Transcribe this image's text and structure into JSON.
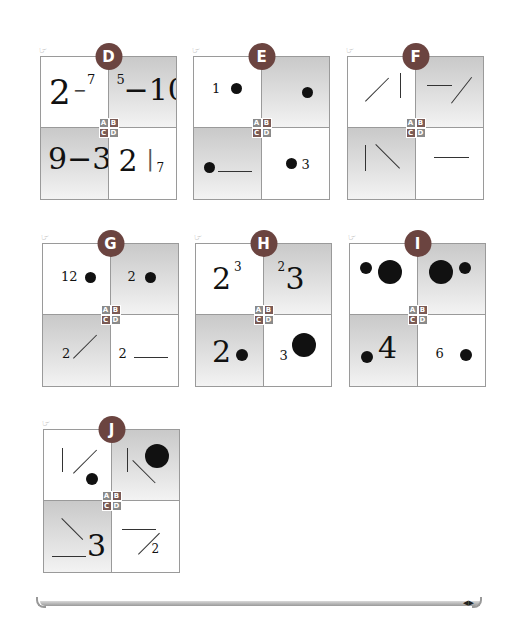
{
  "panels": [
    {
      "id": "D",
      "label": "D",
      "quadrants": {
        "A": {
          "shaded": false,
          "content": "2 − 7 (large 2, dash, small superscript 7)",
          "texts": [
            "2",
            "−",
            "7"
          ]
        },
        "B": {
          "shaded": true,
          "content": "5−10 (small superscript 5, dash, large 10)",
          "texts": [
            "5",
            "−10"
          ]
        },
        "C": {
          "shaded": true,
          "content": "9−3",
          "texts": [
            "9−3"
          ]
        },
        "D": {
          "shaded": false,
          "content": "2 | 7 (large 2, vertical bar, small 7)",
          "texts": [
            "2",
            "|",
            "7"
          ]
        }
      }
    },
    {
      "id": "E",
      "label": "E",
      "quadrants": {
        "A": {
          "shaded": false,
          "content": "1 and one dot",
          "texts": [
            "1"
          ]
        },
        "B": {
          "shaded": true,
          "content": "one dot",
          "texts": []
        },
        "C": {
          "shaded": true,
          "content": "dot and horizontal line",
          "texts": []
        },
        "D": {
          "shaded": false,
          "content": "dot and 3",
          "texts": [
            "3"
          ]
        }
      }
    },
    {
      "id": "F",
      "label": "F",
      "quadrants": {
        "A": {
          "shaded": false,
          "content": "diagonal line / and vertical line"
        },
        "B": {
          "shaded": true,
          "content": "horizontal line and diagonal line /"
        },
        "C": {
          "shaded": true,
          "content": "vertical line and diagonal line \\"
        },
        "D": {
          "shaded": false,
          "content": "horizontal line"
        }
      }
    },
    {
      "id": "G",
      "label": "G",
      "quadrants": {
        "A": {
          "shaded": false,
          "content": "12 and dot",
          "texts": [
            "12"
          ]
        },
        "B": {
          "shaded": true,
          "content": "2 and dot",
          "texts": [
            "2"
          ]
        },
        "C": {
          "shaded": true,
          "content": "2 and diagonal line /",
          "texts": [
            "2"
          ]
        },
        "D": {
          "shaded": false,
          "content": "2 and horizontal line",
          "texts": [
            "2"
          ]
        }
      }
    },
    {
      "id": "H",
      "label": "H",
      "quadrants": {
        "A": {
          "shaded": false,
          "content": "large 2 with superscript 3",
          "texts": [
            "2",
            "3"
          ]
        },
        "B": {
          "shaded": true,
          "content": "superscript 2 with large 3",
          "texts": [
            "2",
            "3"
          ]
        },
        "C": {
          "shaded": true,
          "content": "large 2 and small dot",
          "texts": [
            "2"
          ]
        },
        "D": {
          "shaded": false,
          "content": "small 3 and large dot",
          "texts": [
            "3"
          ]
        }
      }
    },
    {
      "id": "I",
      "label": "I",
      "quadrants": {
        "A": {
          "shaded": false,
          "content": "small dot and large dot"
        },
        "B": {
          "shaded": true,
          "content": "large dot and small dot"
        },
        "C": {
          "shaded": true,
          "content": "small dot and large 4",
          "texts": [
            "4"
          ]
        },
        "D": {
          "shaded": false,
          "content": "6 and dot",
          "texts": [
            "6"
          ]
        }
      }
    },
    {
      "id": "J",
      "label": "J",
      "quadrants": {
        "A": {
          "shaded": false,
          "content": "vertical line, diagonal line /, small dot"
        },
        "B": {
          "shaded": true,
          "content": "vertical line, diagonal line \\, large dot"
        },
        "C": {
          "shaded": true,
          "content": "diagonal line \\, horizontal line, large 3",
          "texts": [
            "3"
          ]
        },
        "D": {
          "shaded": false,
          "content": "horizontal line, diagonal line /, small 2",
          "texts": [
            "2"
          ]
        }
      }
    }
  ],
  "key": {
    "A": "A",
    "B": "B",
    "C": "C",
    "D": "D"
  },
  "text": {
    "D": {
      "a1": "2",
      "a2": "−",
      "a3": "7",
      "b1": "5",
      "b2": "−10",
      "c1": "9−3",
      "d1": "2",
      "d2": "|",
      "d3": "7"
    },
    "E": {
      "a1": "1",
      "d1": "3"
    },
    "G": {
      "a1": "12",
      "b1": "2",
      "c1": "2",
      "d1": "2"
    },
    "H": {
      "a1": "2",
      "a2": "3",
      "b1": "2",
      "b2": "3",
      "c1": "2",
      "d1": "3"
    },
    "I": {
      "c1": "4",
      "d1": "6"
    },
    "J": {
      "c1": "3",
      "d1": "2"
    }
  },
  "icons": {
    "hand": "pointing-hand-icon",
    "next": "next-arrow-icon"
  },
  "colors": {
    "badge": "#6b4440",
    "shade": "#c9c9c9",
    "border": "#9a9a9a"
  }
}
